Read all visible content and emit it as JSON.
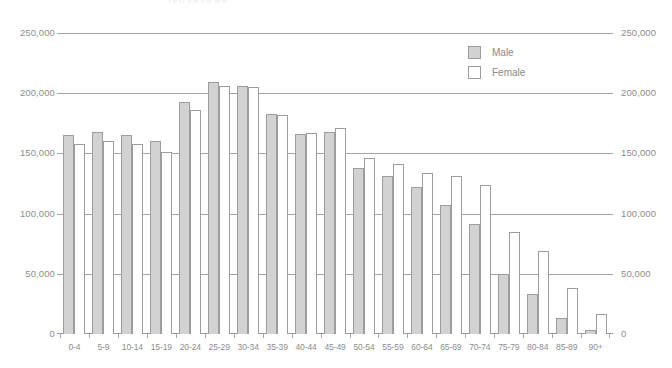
{
  "title_partial": "(ljrj) jig jig gig",
  "legend": {
    "position": "top-right",
    "entries": [
      {
        "label": "Male",
        "swatch": "male-swatch",
        "color": "#d2d2d2"
      },
      {
        "label": "Female",
        "swatch": "female-swatch",
        "color": "#ffffff"
      }
    ]
  },
  "axis": {
    "y_ticks": [
      "0",
      "50,000",
      "100,000",
      "150,000",
      "200,000",
      "250,000"
    ],
    "y_tick_values": [
      0,
      50000,
      100000,
      150000,
      200000,
      250000
    ],
    "y_left_label": "",
    "y_right_label": "",
    "x_label": ""
  },
  "chart_data": {
    "type": "bar",
    "title": "",
    "xlabel": "",
    "ylabel": "",
    "ylim": [
      0,
      250000
    ],
    "grid": true,
    "legend_position": "top-right",
    "categories": [
      "0-4",
      "5-9",
      "10-14",
      "15-19",
      "20-24",
      "25-29",
      "30-34",
      "35-39",
      "40-44",
      "45-49",
      "50-54",
      "55-59",
      "60-64",
      "65-69",
      "70-74",
      "75-79",
      "80-84",
      "85-89",
      "90+"
    ],
    "series": [
      {
        "name": "Male",
        "color": "#d2d2d2",
        "values": [
          165000,
          168000,
          165000,
          160000,
          193000,
          209000,
          206000,
          183000,
          166000,
          168000,
          138000,
          131000,
          122000,
          107000,
          91000,
          50000,
          33000,
          13000,
          3000
        ]
      },
      {
        "name": "Female",
        "color": "#ffffff",
        "values": [
          158000,
          160000,
          158000,
          151000,
          186000,
          206000,
          205000,
          182000,
          167000,
          171000,
          146000,
          141000,
          134000,
          131000,
          124000,
          85000,
          69000,
          38000,
          17000
        ]
      }
    ]
  }
}
